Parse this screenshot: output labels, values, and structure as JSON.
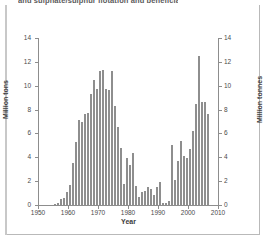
{
  "caption": "and sulphate/sulphur flotation and beneficiation become easier.",
  "chart_data": {
    "type": "bar",
    "title": "",
    "xlabel": "Year",
    "ylabel": "Million tons",
    "ylabel_right": "Million tonnes",
    "xlim": [
      1950,
      2010
    ],
    "ylim": [
      0,
      14
    ],
    "yticks": [
      0,
      2,
      4,
      6,
      8,
      10,
      12,
      14
    ],
    "yticks_right": [
      0,
      2,
      4,
      6,
      8,
      10,
      12,
      14
    ],
    "xticks": [
      1950,
      1960,
      1970,
      1980,
      1990,
      2000,
      2010
    ],
    "grid": false,
    "legend": "none",
    "bar_color": "#8e8e8e",
    "categories": [
      1955,
      1956,
      1957,
      1958,
      1959,
      1960,
      1961,
      1962,
      1963,
      1964,
      1965,
      1966,
      1967,
      1968,
      1969,
      1970,
      1971,
      1972,
      1973,
      1974,
      1975,
      1976,
      1977,
      1978,
      1979,
      1980,
      1981,
      1982,
      1983,
      1984,
      1985,
      1986,
      1987,
      1988,
      1989,
      1990,
      1991,
      1992,
      1993,
      1994,
      1995,
      1996,
      1997,
      1998,
      1999,
      2000,
      2001,
      2002,
      2003,
      2004,
      2005,
      2006
    ],
    "values": [
      0.1,
      0.2,
      0.5,
      0.6,
      1.1,
      1.7,
      3.5,
      5.3,
      7.1,
      7.0,
      7.6,
      7.7,
      9.3,
      10.5,
      9.7,
      11.2,
      11.3,
      9.7,
      9.65,
      11.2,
      8.3,
      6.5,
      4.75,
      1.8,
      3.9,
      3.35,
      4.35,
      1.6,
      0.7,
      1.05,
      1.15,
      1.5,
      1.35,
      0.8,
      1.55,
      1.9,
      0.15,
      0.2,
      0.35,
      5.05,
      2.1,
      3.7,
      5.4,
      4.1,
      3.95,
      4.7,
      6.2,
      8.5,
      12.5,
      8.65,
      8.6,
      7.65
    ],
    "series_note": "annual production"
  }
}
